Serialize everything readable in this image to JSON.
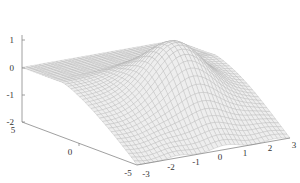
{
  "chart_data": {
    "type": "surface",
    "title": "",
    "xlabel": "",
    "ylabel": "",
    "zlabel": "",
    "x_axis": {
      "ticks": [
        -3,
        -2,
        -1,
        0,
        1,
        2,
        3
      ],
      "range": [
        -3,
        3
      ]
    },
    "y_axis": {
      "ticks": [
        -5,
        0,
        5
      ],
      "range": [
        -5,
        5
      ]
    },
    "z_axis": {
      "ticks": [
        -2,
        -1,
        0,
        1
      ],
      "range": [
        -2,
        1.5
      ]
    },
    "grid": false,
    "legend": null,
    "surface_description": "Wireframe mesh surface, light gray; flat near z=0 for large y, rises to a ridge peak ~1.5 near x≈0, y≈-5..0 and dips to about -2 toward the front (y=-5 edge) with a wavy bottom edge",
    "colors": {
      "mesh_line": "#b0b0b0",
      "surface_fill": "#eeeeee",
      "axis": "#888888",
      "text": "#333333"
    }
  },
  "axes": {
    "z_ticks": [
      "1",
      "0",
      "-1",
      "-2"
    ],
    "y_ticks": [
      "5",
      "0",
      "-5"
    ],
    "x_ticks": [
      "-3",
      "-2",
      "-1",
      "0",
      "1",
      "2",
      "3"
    ]
  }
}
